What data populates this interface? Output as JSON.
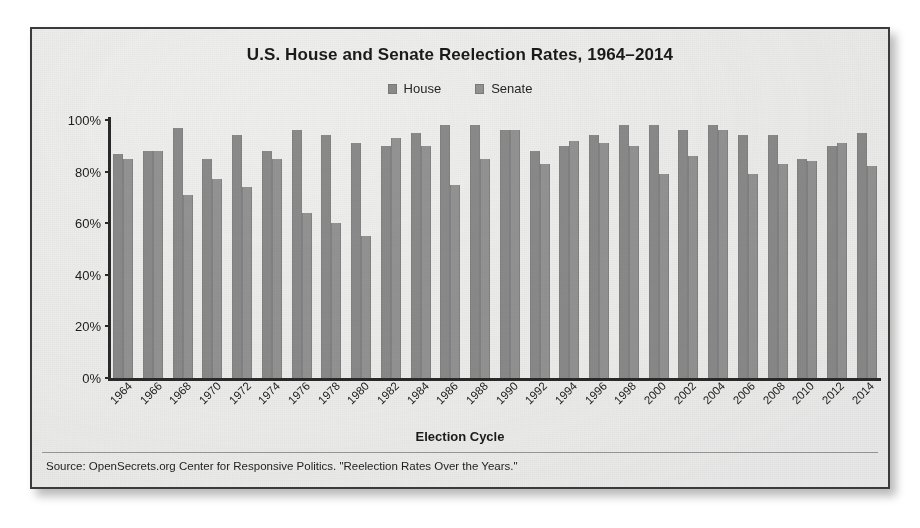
{
  "card": {
    "title": "U.S. House and Senate Reelection Rates, 1964–2014",
    "xaxis_title": "Election Cycle",
    "source": "Source: OpenSecrets.org Center for Responsive Politics. \"Reelection Rates Over the Years.\""
  },
  "legend": {
    "position": "top-center",
    "items": [
      {
        "label": "House",
        "swatch_name": "legend-swatch-house",
        "color": "#8b8b8b"
      },
      {
        "label": "Senate",
        "swatch_name": "legend-swatch-senate",
        "color": "#949494"
      }
    ]
  },
  "colors": {
    "house_bar": "#8b8b8b",
    "senate_bar": "#949494",
    "axis": "#2a2a2a",
    "paper": "#efefee",
    "frame": "#3b3b3b",
    "text": "#1b1b1b"
  },
  "chart_data": {
    "type": "bar",
    "title": "U.S. House and Senate Reelection Rates, 1964–2014",
    "xlabel": "Election Cycle",
    "ylabel": "",
    "ylim": [
      0,
      100
    ],
    "yticks": [
      "0%",
      "20%",
      "40%",
      "60%",
      "80%",
      "100%"
    ],
    "ytick_values": [
      0,
      20,
      40,
      60,
      80,
      100
    ],
    "grid": false,
    "legend_position": "top-center",
    "categories": [
      "1964",
      "1966",
      "1968",
      "1970",
      "1972",
      "1974",
      "1976",
      "1978",
      "1980",
      "1982",
      "1984",
      "1986",
      "1988",
      "1990",
      "1992",
      "1994",
      "1996",
      "1998",
      "2000",
      "2002",
      "2004",
      "2006",
      "2008",
      "2010",
      "2012",
      "2014"
    ],
    "series": [
      {
        "name": "House",
        "values": [
          87,
          88,
          97,
          85,
          94,
          88,
          96,
          94,
          91,
          90,
          95,
          98,
          98,
          96,
          88,
          90,
          94,
          98,
          98,
          96,
          98,
          94,
          94,
          85,
          90,
          95
        ]
      },
      {
        "name": "Senate",
        "values": [
          85,
          88,
          71,
          77,
          74,
          85,
          64,
          60,
          55,
          93,
          90,
          75,
          85,
          96,
          83,
          92,
          91,
          90,
          79,
          86,
          96,
          79,
          83,
          84,
          91,
          82
        ]
      }
    ],
    "source": "Source: OpenSecrets.org Center for Responsive Politics. \"Reelection Rates Over the Years.\""
  }
}
